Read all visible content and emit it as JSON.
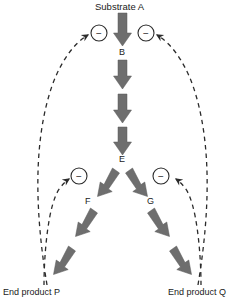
{
  "diagram": {
    "colors": {
      "arrow_fill": "#6e6e6e",
      "arrow_stroke": "#4a4a4a",
      "dashed_line": "#2b2b2b",
      "text": "#1a1a1a",
      "background": "#ffffff",
      "circle_stroke": "#2b2b2b"
    },
    "nodes": [
      {
        "id": "substrate_a",
        "label": "Substrate A",
        "x": 122,
        "y": 8
      },
      {
        "id": "b",
        "label": "B",
        "x": 122,
        "y": 52
      },
      {
        "id": "e",
        "label": "E",
        "x": 122,
        "y": 159
      },
      {
        "id": "f",
        "label": "F",
        "x": 89,
        "y": 201
      },
      {
        "id": "g",
        "label": "G",
        "x": 151,
        "y": 201
      },
      {
        "id": "end_product_p",
        "label": "End product P",
        "x": 40,
        "y": 292
      },
      {
        "id": "end_product_q",
        "label": "End product Q",
        "x": 205,
        "y": 292
      }
    ],
    "inhibition_signs": [
      {
        "id": "inhibit-a-to-b-left",
        "symbol": "−",
        "cx": 99,
        "cy": 33
      },
      {
        "id": "inhibit-a-to-b-right",
        "symbol": "−",
        "cx": 146,
        "cy": 33
      },
      {
        "id": "inhibit-e-to-f",
        "symbol": "−",
        "cx": 79,
        "cy": 176
      },
      {
        "id": "inhibit-e-to-g",
        "symbol": "−",
        "cx": 161,
        "cy": 176
      }
    ],
    "reaction_arrows": [
      {
        "id": "arrow-a-to-b",
        "from": "substrate_a",
        "to": "b"
      },
      {
        "id": "arrow-b-to-c",
        "from": "b",
        "to": "c"
      },
      {
        "id": "arrow-c-to-d",
        "from": "c",
        "to": "d"
      },
      {
        "id": "arrow-d-to-e",
        "from": "d",
        "to": "e"
      },
      {
        "id": "arrow-e-to-f",
        "from": "e",
        "to": "f"
      },
      {
        "id": "arrow-f-to-f2",
        "from": "f",
        "to": "f2"
      },
      {
        "id": "arrow-f2-to-p",
        "from": "f2",
        "to": "end_product_p"
      },
      {
        "id": "arrow-e-to-g",
        "from": "e",
        "to": "g"
      },
      {
        "id": "arrow-g-to-g2",
        "from": "g",
        "to": "g2"
      },
      {
        "id": "arrow-g2-to-q",
        "from": "g2",
        "to": "end_product_q"
      }
    ],
    "feedback_paths": [
      {
        "id": "feedback-p-to-a",
        "from": "end_product_p",
        "to": "inhibit-a-to-b-left",
        "style": "dashed"
      },
      {
        "id": "feedback-q-to-a",
        "from": "end_product_q",
        "to": "inhibit-a-to-b-right",
        "style": "dashed"
      },
      {
        "id": "feedback-p-to-f",
        "from": "end_product_p",
        "to": "inhibit-e-to-f",
        "style": "dashed"
      },
      {
        "id": "feedback-q-to-g",
        "from": "end_product_q",
        "to": "inhibit-e-to-g",
        "style": "dashed"
      }
    ]
  }
}
